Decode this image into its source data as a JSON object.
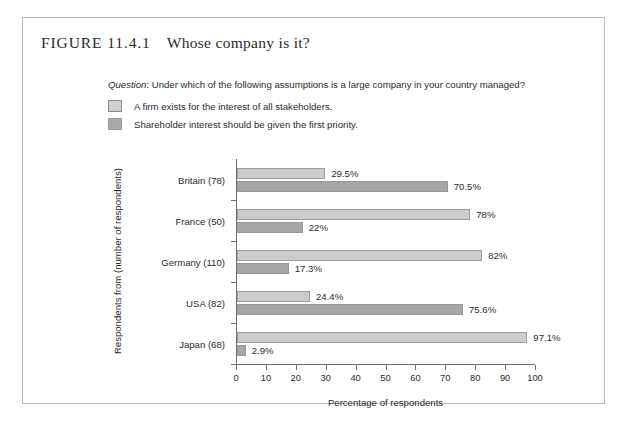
{
  "figure": {
    "label": "FIGURE 11.4.1",
    "caption": "Whose company is it?"
  },
  "question": {
    "prefix": "Question",
    "text": ": Under which of the following assumptions is a large company in your country managed?"
  },
  "legend": {
    "items": [
      {
        "label": "A firm exists for the interest of all stakeholders.",
        "color": "#cbcbcb",
        "style": "light"
      },
      {
        "label": "Shareholder interest should be given the first priority.",
        "color": "#a6a6a6",
        "style": "dark"
      }
    ]
  },
  "chart_data": {
    "type": "bar",
    "orientation": "horizontal",
    "title": "Whose company is it?",
    "xlabel": "Percentage of respondents",
    "ylabel": "Respondents from (number of respondents)",
    "xlim": [
      0,
      100
    ],
    "xticks": [
      0,
      10,
      20,
      30,
      40,
      50,
      60,
      70,
      80,
      90,
      100
    ],
    "xtick_labels": [
      "0",
      "10",
      "20",
      "30",
      "40",
      "50",
      "60",
      "70",
      "80",
      "90",
      "100"
    ],
    "grid": false,
    "legend_position": "top-left",
    "categories": [
      "Britain (78)",
      "France (50)",
      "Germany (110)",
      "USA (82)",
      "Japan (68)"
    ],
    "series": [
      {
        "name": "A firm exists for the interest of all stakeholders.",
        "color": "#cbcbcb",
        "values": [
          29.5,
          78,
          82,
          24.4,
          97.1
        ],
        "labels": [
          "29.5%",
          "78%",
          "82%",
          "24.4%",
          "97.1%"
        ]
      },
      {
        "name": "Shareholder interest should be given the first priority.",
        "color": "#a6a6a6",
        "values": [
          70.5,
          22,
          17.3,
          75.6,
          2.9
        ],
        "labels": [
          "70.5%",
          "22%",
          "17.3%",
          "75.6%",
          "2.9%"
        ]
      }
    ]
  }
}
